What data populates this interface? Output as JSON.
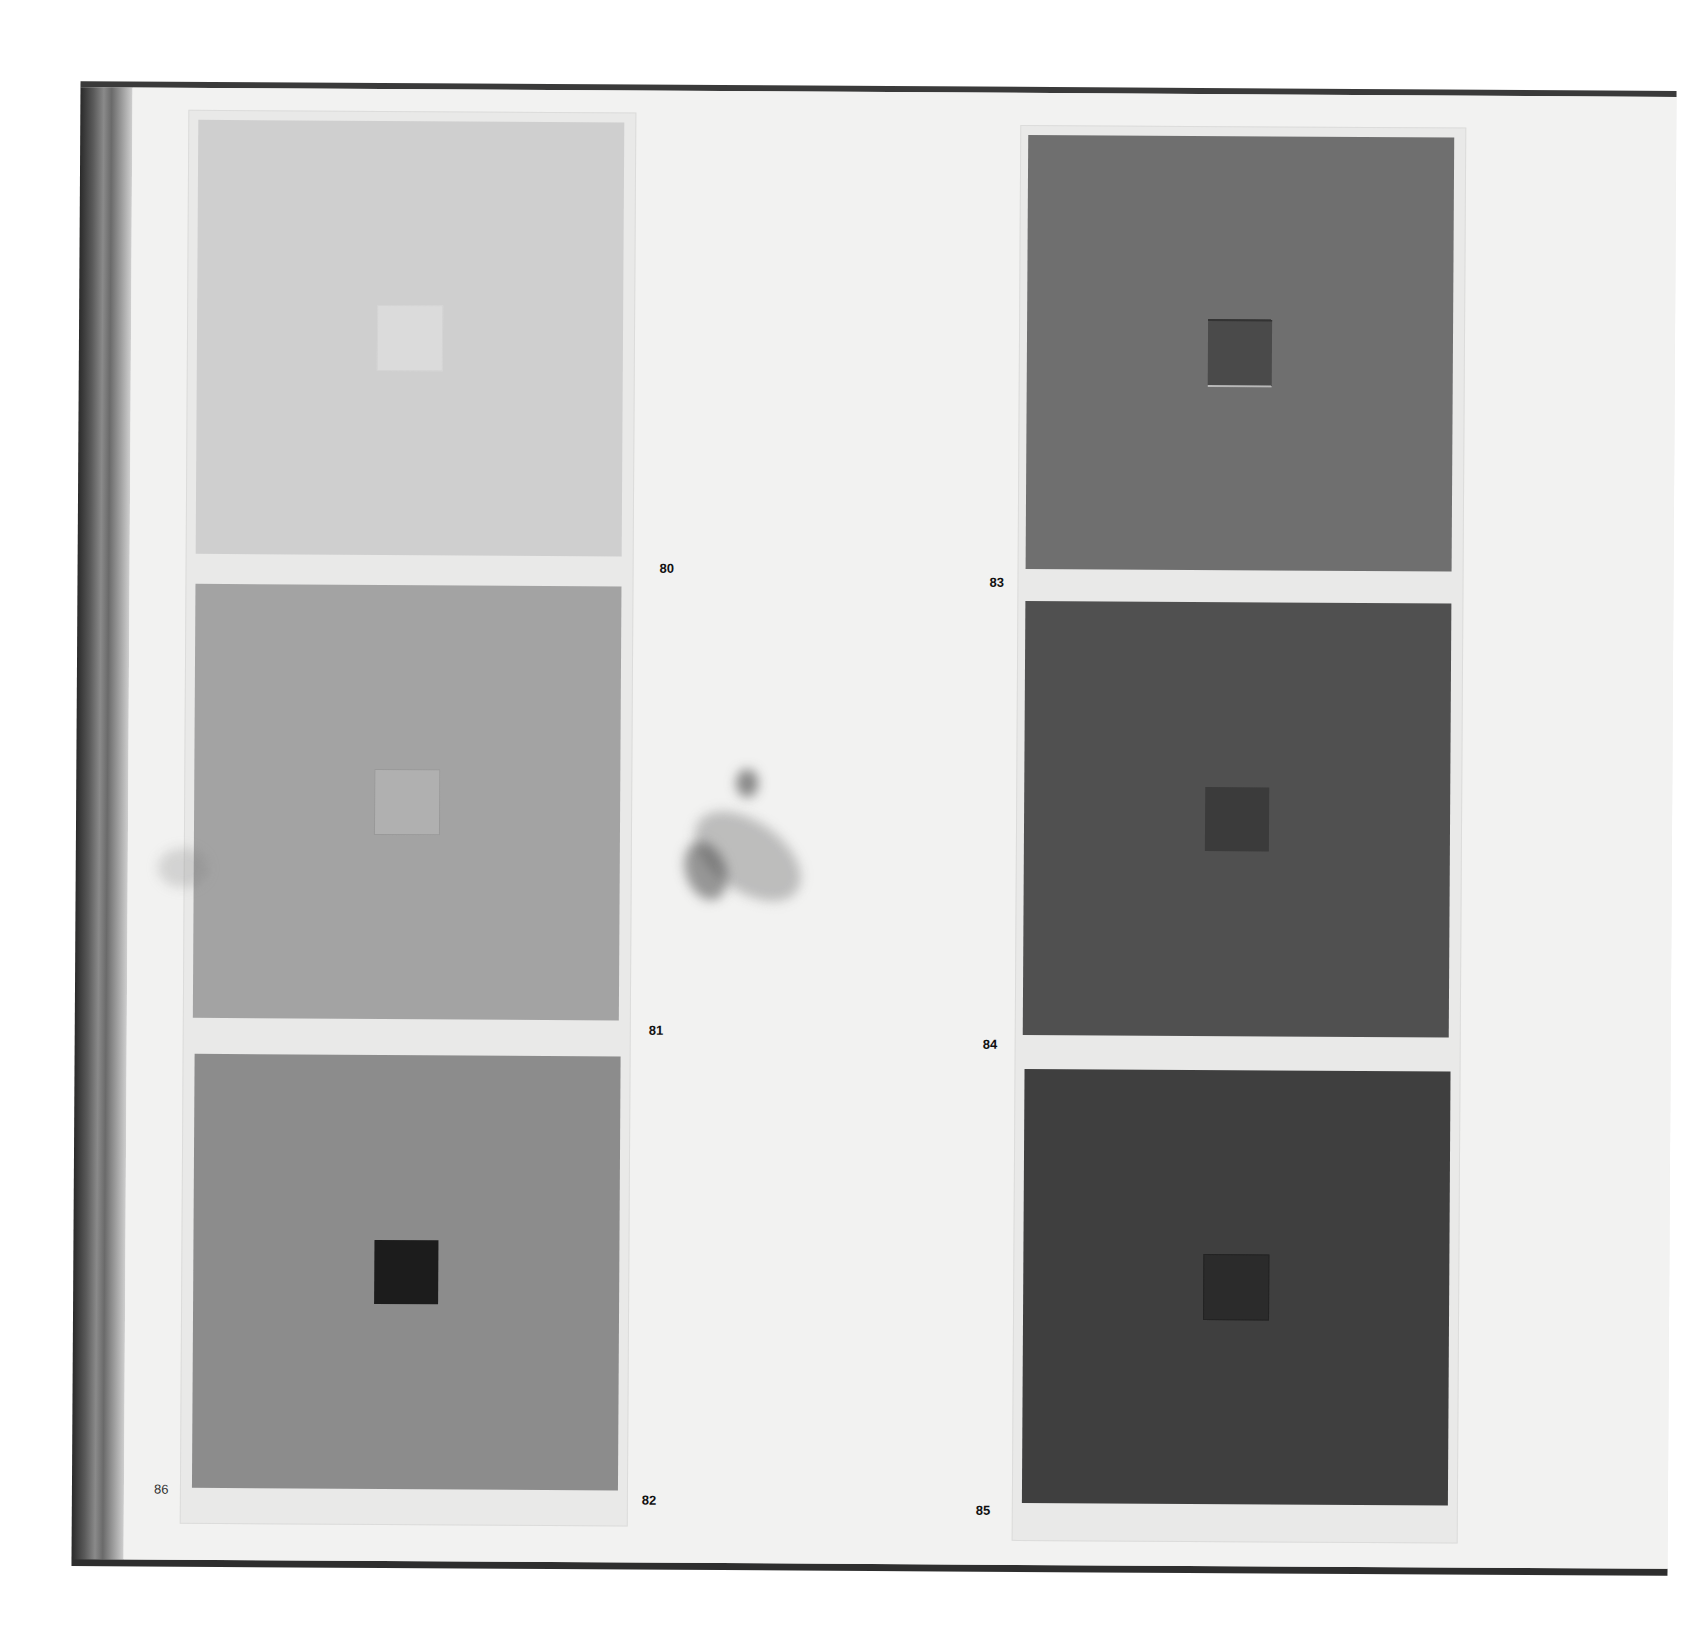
{
  "page": {
    "page_number": "86",
    "background_color": "#f2f2f1"
  },
  "plates": [
    {
      "number": "80",
      "field_color": "#cfcfcf",
      "square_color": "#dbdbdb"
    },
    {
      "number": "81",
      "field_color": "#a3a3a3",
      "square_color": "#b0b0b0"
    },
    {
      "number": "82",
      "field_color": "#8c8c8c",
      "square_color": "#1c1c1c"
    },
    {
      "number": "83",
      "field_color": "#6f6f6f",
      "square_color": "#4a4a4a"
    },
    {
      "number": "84",
      "field_color": "#505050",
      "square_color": "#3b3b3b"
    },
    {
      "number": "85",
      "field_color": "#3f3f3f",
      "square_color": "#2b2b2b"
    }
  ]
}
